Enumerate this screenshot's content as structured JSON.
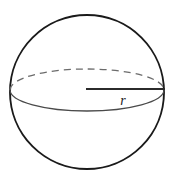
{
  "figure": {
    "name": "sphere-with-radius",
    "canvas": {
      "width": 174,
      "height": 184,
      "background": "#ffffff"
    },
    "sphere": {
      "center_x": 87,
      "center_y": 92,
      "radius": 77,
      "stroke": "#1a1a1a",
      "stroke_width": 1.9,
      "fill": "#ffffff"
    },
    "equator": {
      "center_x": 87,
      "center_y": 90,
      "radius_x": 77,
      "radius_y": 21,
      "back_half": {
        "style": "dashed",
        "stroke": "#6b6b6b",
        "stroke_width": 1.3,
        "dash_pattern": "7 5"
      },
      "front_half": {
        "style": "solid",
        "stroke": "#4a4a4a",
        "stroke_width": 1.3
      }
    },
    "radius_segment": {
      "x1": 86,
      "y1": 89,
      "x2": 165,
      "y2": 89,
      "stroke": "#2b2b2b",
      "stroke_width": 1.9
    },
    "label": {
      "text": "r",
      "x": 123,
      "y": 105,
      "font_size": 14,
      "color": "#1a1a1a"
    }
  },
  "chart_data": {
    "type": "diagram",
    "title": "",
    "elements": [
      {
        "kind": "circle",
        "role": "sphere-silhouette",
        "cx": 87,
        "cy": 92,
        "r": 77
      },
      {
        "kind": "ellipse-arc",
        "role": "equator-back",
        "cx": 87,
        "cy": 90,
        "rx": 77,
        "ry": 21,
        "dashed": true
      },
      {
        "kind": "ellipse-arc",
        "role": "equator-front",
        "cx": 87,
        "cy": 90,
        "rx": 77,
        "ry": 21,
        "dashed": false
      },
      {
        "kind": "segment",
        "role": "radius",
        "from": [
          86,
          89
        ],
        "to": [
          165,
          89
        ],
        "label": "r"
      }
    ],
    "annotations": [
      "r"
    ]
  }
}
